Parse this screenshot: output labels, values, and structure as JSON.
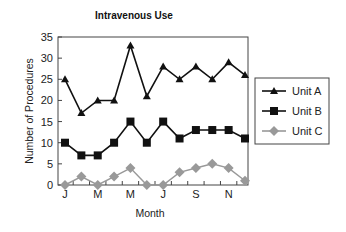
{
  "chart_data": {
    "type": "line",
    "title": "Intravenous Use",
    "xlabel": "Month",
    "ylabel": "Number of Procedures",
    "x": [
      "Jan",
      "Feb",
      "Mar",
      "Apr",
      "May",
      "Jun",
      "Jul",
      "Aug",
      "Sep",
      "Oct",
      "Nov",
      "Dec"
    ],
    "x_tick_labels": [
      "J",
      "",
      "M",
      "",
      "M",
      "",
      "J",
      "",
      "S",
      "",
      "N",
      ""
    ],
    "ylim": [
      0,
      35
    ],
    "y_ticks": [
      0,
      5,
      10,
      15,
      20,
      25,
      30,
      35
    ],
    "grid": false,
    "legend_position": "right",
    "series": [
      {
        "name": "Unit A",
        "marker": "triangle",
        "color": "#111111",
        "values": [
          25,
          17,
          20,
          20,
          33,
          21,
          28,
          25,
          28,
          25,
          29,
          26
        ]
      },
      {
        "name": "Unit B",
        "marker": "square",
        "color": "#111111",
        "values": [
          10,
          7,
          7,
          10,
          15,
          10,
          15,
          11,
          13,
          13,
          13,
          11
        ]
      },
      {
        "name": "Unit C",
        "marker": "diamond",
        "color": "#999999",
        "values": [
          0,
          2,
          0,
          2,
          4,
          0,
          0,
          3,
          4,
          5,
          4,
          1
        ]
      }
    ]
  }
}
